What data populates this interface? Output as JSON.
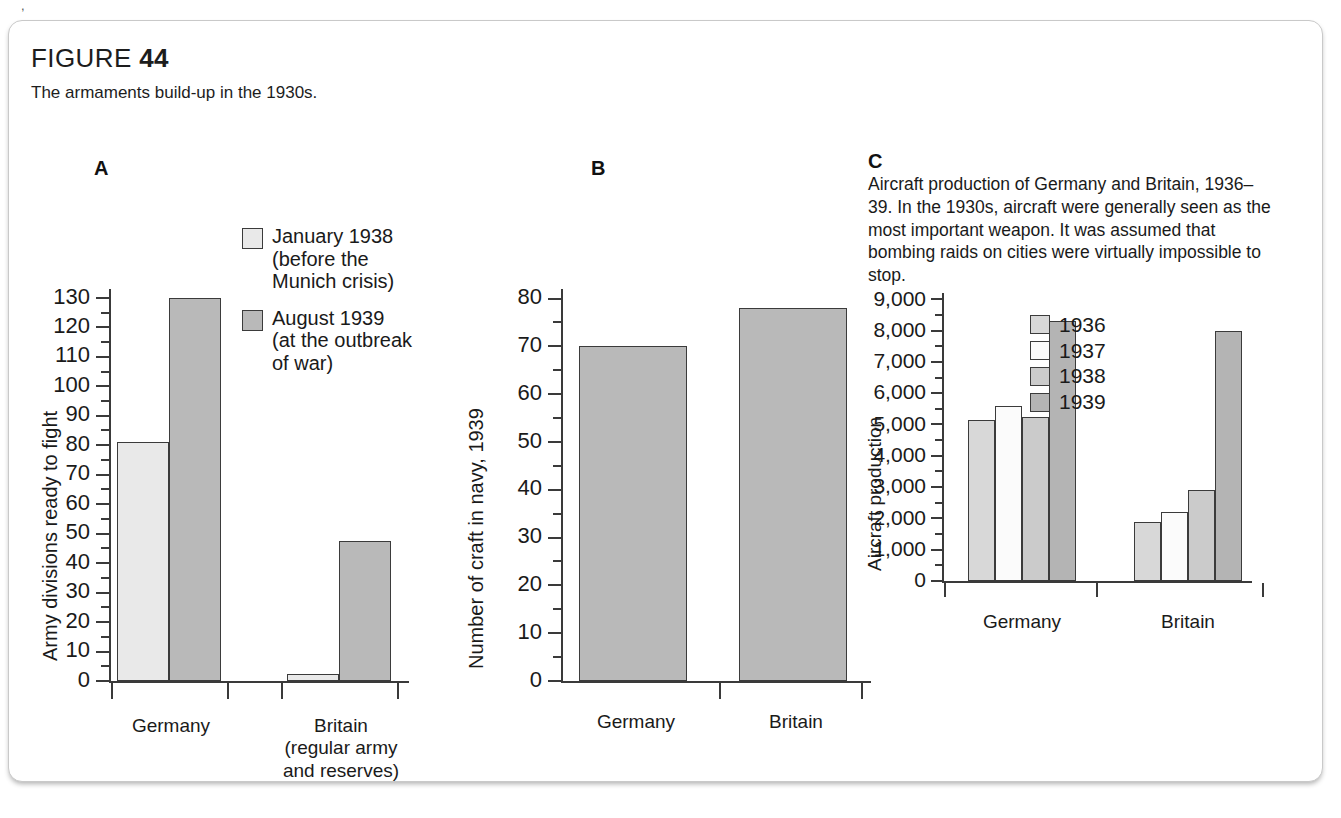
{
  "figure": {
    "label": "FIGURE",
    "number": "44",
    "caption": "The armaments build-up in the 1930s."
  },
  "palette": {
    "light": "#e9e9e9",
    "white": "#fbfbfb",
    "mid": "#cfcfcf",
    "dark": "#b9b9b9",
    "stroke": "#3b3b3b",
    "text": "#1a1a1a"
  },
  "panelA": {
    "letter": "A",
    "legend": [
      {
        "label": "January 1938\n(before the\nMunich crisis)",
        "color": "#e9e9e9"
      },
      {
        "label": "August 1939\n(at the outbreak\nof war)",
        "color": "#b9b9b9"
      }
    ]
  },
  "panelB": {
    "letter": "B"
  },
  "panelC": {
    "letter": "C",
    "description": "Aircraft production of Germany and Britain, 1936–39. In the 1930s, aircraft were generally seen as the most important weapon. It was assumed that bombing raids on cities were virtually impossible to stop.",
    "legend": [
      {
        "label": "1936",
        "color": "#d8d8d8"
      },
      {
        "label": "1937",
        "color": "#fbfbfb"
      },
      {
        "label": "1938",
        "color": "#cbcbcb"
      },
      {
        "label": "1939",
        "color": "#b4b4b4"
      }
    ]
  },
  "chart_data": [
    {
      "id": "A",
      "type": "bar",
      "title": "A",
      "xlabel": "",
      "ylabel": "Army divisions ready to fight",
      "categories": [
        "Germany",
        "Britain\n(regular army\nand reserves)"
      ],
      "category_labels_flat": [
        "Germany",
        "Britain (regular army and reserves)"
      ],
      "series": [
        {
          "name": "January 1938 (before the Munich crisis)",
          "values": [
            81,
            2.5
          ]
        },
        {
          "name": "August 1939 (at the outbreak of war)",
          "values": [
            130,
            47.5
          ]
        }
      ],
      "ylim": [
        0,
        133
      ],
      "yticks": [
        0,
        10,
        20,
        30,
        40,
        50,
        60,
        70,
        80,
        90,
        100,
        110,
        120,
        130
      ],
      "ytick_labels": [
        "0",
        "10",
        "20",
        "30",
        "40",
        "50",
        "60",
        "70",
        "80",
        "90",
        "100",
        "110",
        "120",
        "130"
      ],
      "minor_tick_step": 5,
      "grid": false,
      "legend_position": "inside-top-right"
    },
    {
      "id": "B",
      "type": "bar",
      "title": "B",
      "xlabel": "",
      "ylabel": "Number of craft in navy, 1939",
      "categories": [
        "Germany",
        "Britain"
      ],
      "values": [
        70,
        78
      ],
      "ylim": [
        0,
        82
      ],
      "yticks": [
        0,
        10,
        20,
        30,
        40,
        50,
        60,
        70,
        80
      ],
      "ytick_labels": [
        "0",
        "10",
        "20",
        "30",
        "40",
        "50",
        "60",
        "70",
        "80"
      ],
      "minor_tick_step": 5,
      "grid": false,
      "legend_position": "none"
    },
    {
      "id": "C",
      "type": "bar",
      "title": "C",
      "xlabel": "",
      "ylabel": "Aircraft production",
      "categories": [
        "Germany",
        "Britain"
      ],
      "series": [
        {
          "name": "1936",
          "values": [
            5150,
            1900
          ]
        },
        {
          "name": "1937",
          "values": [
            5600,
            2200
          ]
        },
        {
          "name": "1938",
          "values": [
            5250,
            2900
          ]
        },
        {
          "name": "1939",
          "values": [
            8300,
            8000
          ]
        }
      ],
      "ylim": [
        0,
        9200
      ],
      "yticks": [
        0,
        1000,
        2000,
        3000,
        4000,
        5000,
        6000,
        7000,
        8000,
        9000
      ],
      "ytick_labels": [
        "0",
        "1,000",
        "2,000",
        "3,000",
        "4,000",
        "5,000",
        "6,000",
        "7,000",
        "8,000",
        "9,000"
      ],
      "minor_tick_step": 500,
      "grid": false,
      "legend_position": "inside-top-right"
    }
  ]
}
